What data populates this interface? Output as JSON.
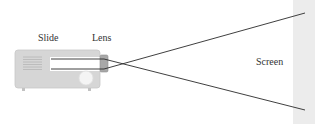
{
  "diagram": {
    "title": "",
    "labels": {
      "slide": "Slide",
      "lens": "Lens",
      "screen": "Screen"
    },
    "colors": {
      "projector_body": "#d6d6d6",
      "projector_edge": "#c2c2c2",
      "slide_window": "#ffffff",
      "lens": "#a8a8a8",
      "ray": "#2a2a2a",
      "screen": "#ececec",
      "text": "#333333"
    }
  }
}
